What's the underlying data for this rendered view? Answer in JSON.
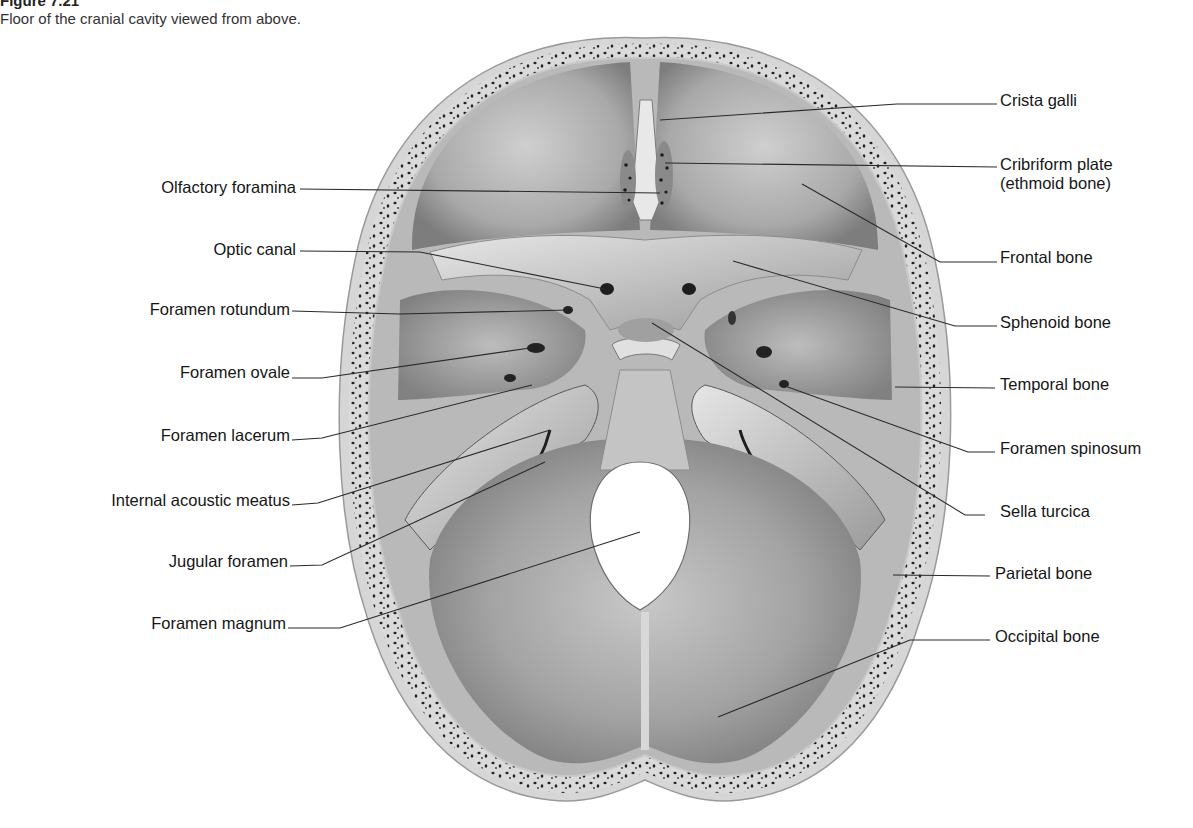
{
  "figure": {
    "title": "Figure 7.21",
    "caption": "Floor of the cranial cavity viewed from above."
  },
  "labels_left": [
    {
      "id": "olfactory-foramina",
      "text": "Olfactory foramina",
      "x": 296,
      "y": 178,
      "line": [
        [
          300,
          189
        ],
        [
          660,
          193
        ]
      ]
    },
    {
      "id": "optic-canal",
      "text": "Optic canal",
      "x": 296,
      "y": 240,
      "line": [
        [
          300,
          251
        ],
        [
          420,
          252
        ],
        [
          605,
          289
        ]
      ]
    },
    {
      "id": "foramen-rotundum",
      "text": "Foramen rotundum",
      "x": 290,
      "y": 300,
      "line": [
        [
          292,
          311
        ],
        [
          400,
          314
        ],
        [
          568,
          310
        ]
      ]
    },
    {
      "id": "foramen-ovale",
      "text": "Foramen ovale",
      "x": 290,
      "y": 363,
      "line": [
        [
          292,
          378
        ],
        [
          322,
          378
        ],
        [
          530,
          348
        ]
      ]
    },
    {
      "id": "foramen-lacerum",
      "text": "Foramen lacerum",
      "x": 290,
      "y": 426,
      "line": [
        [
          292,
          440
        ],
        [
          322,
          438
        ],
        [
          532,
          385
        ]
      ]
    },
    {
      "id": "internal-acoustic-meatus",
      "text": "Internal acoustic meatus",
      "x": 290,
      "y": 491,
      "line": [
        [
          292,
          505
        ],
        [
          318,
          503
        ],
        [
          550,
          430
        ]
      ]
    },
    {
      "id": "jugular-foramen",
      "text": "Jugular foramen",
      "x": 288,
      "y": 552,
      "line": [
        [
          290,
          566
        ],
        [
          322,
          565
        ],
        [
          545,
          462
        ]
      ]
    },
    {
      "id": "foramen-magnum",
      "text": "Foramen magnum",
      "x": 286,
      "y": 614,
      "line": [
        [
          288,
          628
        ],
        [
          340,
          628
        ],
        [
          640,
          532
        ]
      ]
    }
  ],
  "labels_right": [
    {
      "id": "crista-galli",
      "text": "Crista galli",
      "x": 1000,
      "y": 91,
      "line": [
        [
          997,
          104
        ],
        [
          897,
          104
        ],
        [
          660,
          120
        ]
      ]
    },
    {
      "id": "cribriform-plate",
      "text": "Cribriform plate",
      "text2": "(ethmoid bone)",
      "x": 1000,
      "y": 155,
      "line": [
        [
          997,
          167
        ],
        [
          665,
          163
        ]
      ]
    },
    {
      "id": "frontal-bone",
      "text": "Frontal bone",
      "x": 1000,
      "y": 248,
      "line": [
        [
          997,
          262
        ],
        [
          940,
          262
        ],
        [
          802,
          184
        ]
      ]
    },
    {
      "id": "sphenoid-bone",
      "text": "Sphenoid bone",
      "x": 1000,
      "y": 313,
      "line": [
        [
          997,
          326
        ],
        [
          955,
          326
        ],
        [
          733,
          261
        ]
      ]
    },
    {
      "id": "temporal-bone",
      "text": "Temporal bone",
      "x": 1000,
      "y": 375,
      "line": [
        [
          995,
          388
        ],
        [
          895,
          387
        ]
      ]
    },
    {
      "id": "foramen-spinosum",
      "text": "Foramen spinosum",
      "x": 1000,
      "y": 439,
      "line": [
        [
          995,
          452
        ],
        [
          968,
          452
        ],
        [
          785,
          386
        ]
      ]
    },
    {
      "id": "sella-turcica",
      "text": "Sella turcica",
      "x": 1000,
      "y": 502,
      "line": [
        [
          985,
          515
        ],
        [
          965,
          515
        ],
        [
          652,
          323
        ]
      ]
    },
    {
      "id": "parietal-bone",
      "text": "Parietal bone",
      "x": 995,
      "y": 564,
      "line": [
        [
          990,
          576
        ],
        [
          893,
          575
        ]
      ]
    },
    {
      "id": "occipital-bone",
      "text": "Occipital bone",
      "x": 995,
      "y": 627,
      "line": [
        [
          990,
          640
        ],
        [
          910,
          640
        ],
        [
          718,
          717
        ]
      ]
    }
  ],
  "colors": {
    "background": "#ffffff",
    "bone_outer": "#d8d8d8",
    "bone_inner": "#9c9c9c",
    "diploe_spots": "#1e1e1e",
    "leader_line": "#2a2a2a",
    "foramen_magnum_fill": "#ffffff"
  }
}
